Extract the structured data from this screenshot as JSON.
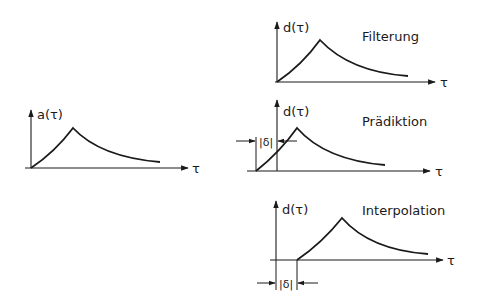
{
  "diagram": {
    "type": "signal-estimation-comparison",
    "colors": {
      "ink": "#1a1a1a",
      "background": "#ffffff"
    },
    "input_plot": {
      "y_label": "a(τ)",
      "x_label": "τ"
    },
    "output_plots": [
      {
        "id": "filterung",
        "title": "Filterung",
        "y_label": "d(τ)",
        "x_label": "τ",
        "shift": "none"
      },
      {
        "id": "praediktion",
        "title": "Prädiktion",
        "y_label": "d(τ)",
        "x_label": "τ",
        "shift": "left",
        "shift_label": "|δ|"
      },
      {
        "id": "interpolation",
        "title": "Interpolation",
        "y_label": "d(τ)",
        "x_label": "τ",
        "shift": "right",
        "shift_label": "|δ|"
      }
    ]
  }
}
